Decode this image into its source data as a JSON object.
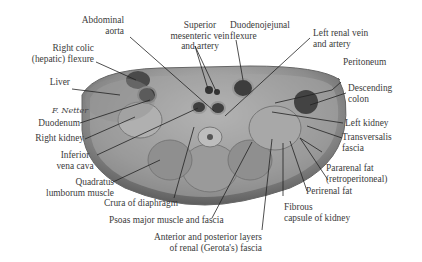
{
  "figure": {
    "type": "anatomical cross-section",
    "signature": "F. Netter"
  },
  "labels": {
    "abdominal_aorta": "Abdominal\naorta",
    "superior_mesenteric": "Superior\nmesenteric vein\nand artery",
    "duodenojejunal_flexure": "Duodenojejunal\nflexure",
    "left_renal_vein_artery": "Left renal vein\nand artery",
    "right_colic_flexure": "Right colic\n(hepatic) flexure",
    "peritoneum": "Peritoneum",
    "liver": "Liver",
    "descending_colon": "Descending\ncolon",
    "duodenum": "Duodenum",
    "right_kidney": "Right kidney",
    "left_kidney": "Left kidney",
    "inferior_vena_cava": "Inferior\nvena cava",
    "transversalis_fascia": "Transversalis\nfascia",
    "quadratus_lumborum": "Quadratus\nlumborum muscle",
    "pararenal_fat": "Pararenal fat\n(retroperitoneal)",
    "perirenal_fat": "Perirenal fat",
    "crura_of_diaphragm": "Crura of diaphragm",
    "fibrous_capsule": "Fibrous\ncapsule of kidney",
    "psoas_major": "Psoas major muscle and fascia",
    "renal_fascia": "Anterior and posterior layers\nof renal (Gerota's) fascia"
  }
}
